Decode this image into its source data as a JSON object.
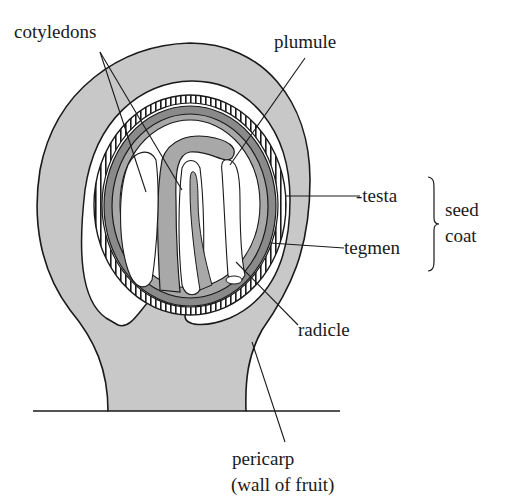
{
  "diagram": {
    "labels": {
      "cotyledons": "cotyledons",
      "plumule": "plumule",
      "testa": "-testa",
      "tegmen": "tegmen",
      "seed_coat_line1": "seed",
      "seed_coat_line2": "coat",
      "radicle": "radicle",
      "pericarp_line1": "pericarp",
      "pericarp_line2": "(wall of fruit)"
    },
    "colors": {
      "pericarp": "#c8c8c8",
      "cavity": "#ffffff",
      "tegmen_dark": "#8a8a8a",
      "embryo_mid": "#a8a8a8",
      "outline": "#1a1a1a"
    }
  }
}
